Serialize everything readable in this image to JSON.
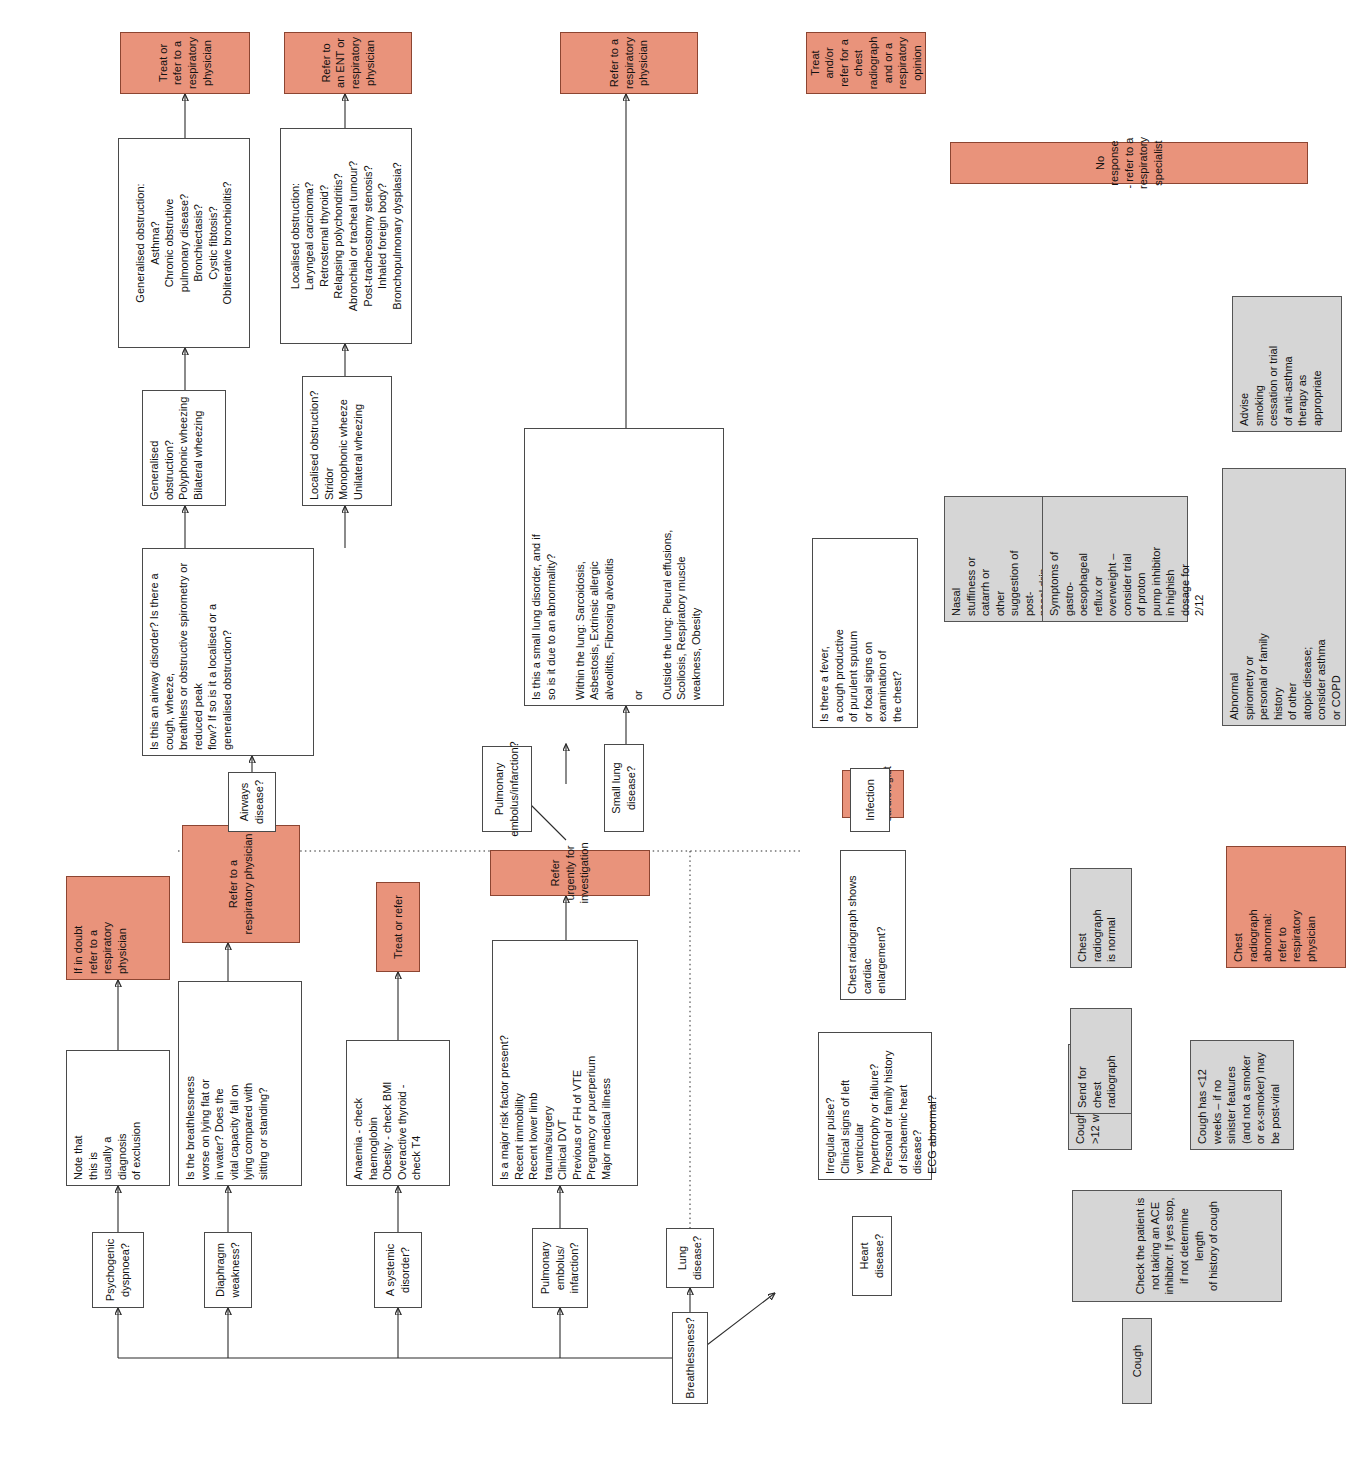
{
  "colors": {
    "action": "#e9937b",
    "cough_stage": "#d6d6d6",
    "decision": "#ffffff",
    "line": "#2b2b2b"
  },
  "legend": {
    "salmon_meaning": "Referral / action box",
    "grey_meaning": "Cough pathway step",
    "white_meaning": "Question or feature list"
  },
  "breathlessness": {
    "root_label": "Breathlessness?",
    "branches": [
      {
        "name": "psychogenic",
        "label": "Psychogenic dyspnoea?",
        "detail": "Note that\nthis is\nusually a\ndiagnosis\nof exclusion",
        "action": "If in doubt\nrefer to a\nrespiratory\nphysician"
      },
      {
        "name": "diaphragm",
        "label": "Diaphragm weakness?",
        "detail": "Is the breathlessness\nworse on lying flat or\nin water? Does the\nvital capacity fall on\nlying compared with\nsitting or standing?",
        "action": "Refer to a\nrespiratory physician"
      },
      {
        "name": "systemic",
        "label": "A systemic disorder?",
        "detail": "Anaemia - check\nhaemoglobin\nObesity - check BMI\nOveractive thyroid -\ncheck T4",
        "action": "Treat or refer"
      },
      {
        "name": "pulmonary-embolus",
        "label": "Pulmonary embolus/\ninfarction?",
        "detail": "Is a major risk factor present?\nRecent immobility\nRecent lower limb\ntrauma/surgery\nClinical DVT\nPrevious or FH of VTE\nPregnancy or puerperium\nMajor medical illness",
        "action": "Refer urgently for investigation"
      },
      {
        "name": "lung-disease",
        "label": "Lung disease?"
      },
      {
        "name": "heart-disease",
        "label": "Heart disease?",
        "detail": "Irregular pulse?\nClinical signs of left ventricular\nhypertrophy or failure?\nPersonal or family history\nof ischaemic heart disease?\nECG abnormal?",
        "detail2": "Chest radiograph shows cardiac\nenlargement?",
        "action": "Treat or refer to cardiologist"
      }
    ]
  },
  "lung_subgroups": [
    {
      "name": "pulmonary-embolus-lung",
      "label": "Pulmonary\nembolus/infarction?"
    },
    {
      "name": "airways-disease",
      "label": "Airways\ndisease?",
      "question": "Is this an airway disorder? Is there a cough, wheeze,\nbreathless or obstructive spirometry or reduced peak\nflow? If so is it a localised or a generalised obstruction?",
      "generalised": {
        "signs": "Generalised obstruction?\nPolyphonic wheezing\nBilateral wheezing",
        "causes": "Generalised obstruction:\nAsthma?\nChronic obstrutive\npulmonary disease?\nBronchiectasis?\nCystic fibtosis?\nObliterative bronchiolitis?",
        "action": "Treat or refer to a\nrespiratory physician"
      },
      "localised": {
        "signs": "Localised obstruction?\nStridor\nMonophonic wheeze\nUnilateral wheezing",
        "causes": "Localised obstruction:\nLaryngeal carcinoma?\nRetrosternal thyroid?\nRelapsing polychondritis?\nAbronchial or tracheal tumour?\nPost-tracheostomy stenosis?\nInhaled foreign body?\nBronchopulmonary dysplasia?",
        "action": "Refer to an ENT or\nrespiratory physician"
      }
    },
    {
      "name": "small-lung-disease",
      "label": "Small lung disease?",
      "detail": "Is this a small lung disorder, and if\nso is it due to an abnormality?\n\nWithin the lung: Sarcoidosis,\nAsbestosis, Extrinsic allergic\nalveolitits, Fibrosing alveolitis\n\n                      or\n\nOutside the lung: Pleural effusions,\nScoliosis, Respiratory muscle\n       weakness, Obesity",
      "action": "Refer to a respiratory\nphysician"
    },
    {
      "name": "infection",
      "label": "Infection",
      "detail": "Is there a fever,\na cough productive\nof purulent sputum\nor focal signs on\nexamination of\nthe chest?",
      "action": "Treat and/or refer for a\nchest radiograph and or a\nrespiratory opinion"
    }
  ],
  "cough": {
    "root_label": "Cough",
    "first_step": "Check the patient is not taking an ACE\ninhibitor. If yes stop, if not determine length\nof history of cough",
    "duration_long": "Cough has lasted\n>12 weeks",
    "duration_short": "Cough has <12\nweeks – if no\nsinister features\n(and not a smoker\nor ex-smoker) may\nbe post-viral",
    "send_radiograph": "Send for\nchest\nradiograph",
    "radiograph_normal": "Chest\nradiograph\nis normal",
    "radiograph_abnormal": "Chest\nradiograph\nabnormal:\nrefer to\nrespiratory\nphysician",
    "outcomes": [
      "Nasal\nstuffiness or\ncatarrh or\nother\nsuggestion of\npost-\nnasal drip\ndisease –\nconsider\ntrial of\nintranasal\nsteroids",
      "Symptoms of\ngastro-\noesophageal\nreflux or\noverweight –\nconsider trial\nof proton\npump inhibitor\nin highish\ndosage for\n2/12",
      "Abnormal\nspirometry or\npersonal or family\nhistory\nof other\natopic disease;\nconsider asthma\nor COPD"
    ],
    "advise": "Advise\nsmoking\ncessation or trial\nof anti-asthma\ntherapy as\nappropriate",
    "final_action": "No response - refer to a respiratory specialist"
  }
}
